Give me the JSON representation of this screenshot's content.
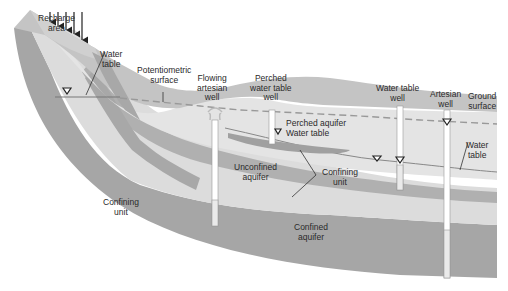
{
  "diagram": {
    "type": "groundwater-aquifer-cross-section",
    "colors": {
      "background": "#ffffff",
      "confining_unit": "#a6a6a6",
      "aquifer_light": "#dcdcdc",
      "aquifer_lighter": "#e6e6e6",
      "surface_layer": "#c4c4c4",
      "well_casing": "#ffffff",
      "line": "#555555"
    },
    "labels": {
      "recharge_area": [
        "Recharge",
        "area"
      ],
      "water_table_left": [
        "Water",
        "table"
      ],
      "potentiometric_surface": [
        "Potentiometric",
        "surface"
      ],
      "flowing_artesian_well": [
        "Flowing",
        "artesian",
        "well"
      ],
      "perched_water_table_well": [
        "Perched",
        "water table",
        "well"
      ],
      "water_table_well": [
        "Water table",
        "well"
      ],
      "artesian_well": [
        "Artesian",
        "well"
      ],
      "ground_surface": [
        "Ground",
        "surface"
      ],
      "perched_aquifer": "Perched aquifer",
      "perched_water_table": "Water table",
      "unconfined_aquifer": [
        "Unconfined",
        "aquifer"
      ],
      "confining_unit_middle": [
        "Confining",
        "unit"
      ],
      "water_table_right": [
        "Water",
        "table"
      ],
      "confining_unit_left": [
        "Confining",
        "unit"
      ],
      "confined_aquifer": [
        "Confined",
        "aquifer"
      ]
    },
    "symbols": {
      "water_level_marker": "▽",
      "recharge_arrows": 5
    }
  }
}
